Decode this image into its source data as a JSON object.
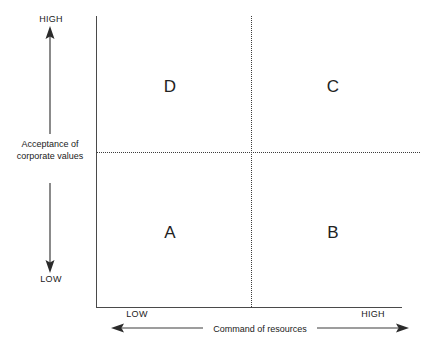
{
  "diagram": {
    "type": "2x2-matrix",
    "quadrants": [
      {
        "id": "d",
        "label": "D",
        "position": "top-left"
      },
      {
        "id": "c",
        "label": "C",
        "position": "top-right"
      },
      {
        "id": "a",
        "label": "A",
        "position": "bottom-left"
      },
      {
        "id": "b",
        "label": "B",
        "position": "bottom-right"
      }
    ],
    "y_axis": {
      "label_line1": "Acceptance of",
      "label_line2": "corporate values",
      "high_tick": "HIGH",
      "low_tick": "LOW"
    },
    "x_axis": {
      "label": "Command of resources",
      "low_tick": "LOW",
      "high_tick": "HIGH"
    },
    "colors": {
      "axis": "#4a4a4a",
      "divider": "#3d3d3d",
      "text": "#1a1a1a",
      "background": "#ffffff"
    }
  }
}
